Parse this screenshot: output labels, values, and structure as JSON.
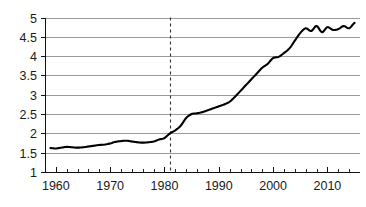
{
  "chart_data": {
    "type": "line",
    "title": "",
    "subtitle": "",
    "xlabel": "",
    "ylabel": "",
    "xlim": [
      1958,
      2016
    ],
    "ylim": [
      1,
      5
    ],
    "grid": true,
    "legend": null,
    "legend_position": "none",
    "y_ticks": [
      "1",
      "1.5",
      "2",
      "2.5",
      "3",
      "3.5",
      "4",
      "4.5",
      "5"
    ],
    "y_tick_values": [
      1,
      1.5,
      2,
      2.5,
      3,
      3.5,
      4,
      4.5,
      5
    ],
    "x_ticks": [
      "1960",
      "1970",
      "1980",
      "1990",
      "2000",
      "2010"
    ],
    "x_tick_values": [
      1960,
      1970,
      1980,
      1990,
      2000,
      2010
    ],
    "x_minor_step": 2,
    "annotations": [
      {
        "type": "vertical-dashed-line",
        "name": "reference-line-1981",
        "x": 1981,
        "label": "",
        "color": "#333333"
      }
    ],
    "series": [
      {
        "name": "series-1",
        "color": "#000000",
        "x": [
          1959,
          1960,
          1961,
          1962,
          1963,
          1964,
          1965,
          1966,
          1967,
          1968,
          1969,
          1970,
          1971,
          1972,
          1973,
          1974,
          1975,
          1976,
          1977,
          1978,
          1979,
          1980,
          1981,
          1982,
          1983,
          1984,
          1985,
          1986,
          1987,
          1988,
          1989,
          1990,
          1991,
          1992,
          1993,
          1994,
          1995,
          1996,
          1997,
          1998,
          1999,
          2000,
          2001,
          2002,
          2003,
          2004,
          2005,
          2006,
          2007,
          2008,
          2009,
          2010,
          2011,
          2012,
          2013,
          2014,
          2015
        ],
        "values": [
          1.62,
          1.61,
          1.63,
          1.65,
          1.64,
          1.63,
          1.64,
          1.66,
          1.68,
          1.7,
          1.71,
          1.74,
          1.78,
          1.8,
          1.81,
          1.79,
          1.77,
          1.76,
          1.77,
          1.79,
          1.84,
          1.88,
          2.0,
          2.08,
          2.2,
          2.4,
          2.5,
          2.52,
          2.55,
          2.6,
          2.65,
          2.7,
          2.75,
          2.82,
          2.95,
          3.1,
          3.25,
          3.4,
          3.55,
          3.7,
          3.8,
          3.95,
          3.98,
          4.08,
          4.2,
          4.4,
          4.6,
          4.72,
          4.65,
          4.78,
          4.62,
          4.75,
          4.68,
          4.7,
          4.78,
          4.72,
          4.86
        ]
      }
    ]
  }
}
